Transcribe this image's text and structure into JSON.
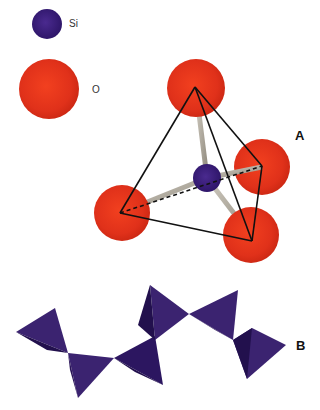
{
  "legend": {
    "silicon": {
      "label": "Si",
      "color": "#3a1b7a"
    },
    "oxygen": {
      "label": "O",
      "color": "#e8331a"
    }
  },
  "panels": {
    "a": {
      "label": "A",
      "description": "SiO4 tetrahedron: central silicon atom bonded to four oxygen atoms"
    },
    "b": {
      "label": "B",
      "description": "Chain of corner-sharing silica tetrahedra"
    }
  },
  "colors": {
    "bond": "#b8b2a6",
    "edge": "#111111",
    "tetra_light": "#3d2470",
    "tetra_dark": "#22104d"
  },
  "chain_tetrahedra_count": 6
}
